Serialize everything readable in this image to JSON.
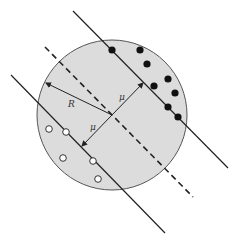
{
  "diagram": {
    "title": "",
    "colors": {
      "background": "#ffffff",
      "circle_fill": "#dcdcdc",
      "circle_stroke": "#555555",
      "line": "#222222",
      "filled_point": "#111111",
      "open_point_fill": "#ffffff"
    },
    "labels": {
      "radius": "R",
      "margin_upper": "μ",
      "margin_lower": "μ"
    },
    "circle": {
      "cx": 112,
      "cy": 115,
      "r": 75
    },
    "lines": {
      "upper_solid": {
        "x1": 73,
        "y1": 11,
        "x2": 228,
        "y2": 168
      },
      "dashed_center": {
        "x1": 45,
        "y1": 47,
        "x2": 193,
        "y2": 197
      },
      "lower_solid": {
        "x1": 11,
        "y1": 75,
        "x2": 165,
        "y2": 233
      }
    },
    "filled_points": [
      {
        "x": 112,
        "y": 50
      },
      {
        "x": 140,
        "y": 50
      },
      {
        "x": 147,
        "y": 64
      },
      {
        "x": 154,
        "y": 86
      },
      {
        "x": 168,
        "y": 79
      },
      {
        "x": 175,
        "y": 93
      },
      {
        "x": 168,
        "y": 107
      },
      {
        "x": 178,
        "y": 117
      }
    ],
    "open_points": [
      {
        "x": 49,
        "y": 129
      },
      {
        "x": 66,
        "y": 132
      },
      {
        "x": 63,
        "y": 158
      },
      {
        "x": 93,
        "y": 161
      },
      {
        "x": 98,
        "y": 179
      }
    ]
  }
}
